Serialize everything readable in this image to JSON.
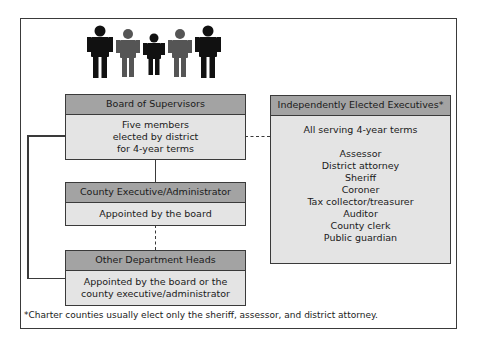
{
  "figures": {
    "icon": "people-group-icon",
    "colors": [
      "#111111",
      "#555555",
      "#111111",
      "#555555",
      "#111111"
    ]
  },
  "boxes": {
    "board": {
      "title": "Board of Supervisors",
      "lines": [
        "Five members",
        "elected by district",
        "for 4-year terms"
      ]
    },
    "executive": {
      "title": "County Executive/Administrator",
      "lines": [
        "Appointed by the board"
      ]
    },
    "departments": {
      "title": "Other Department Heads",
      "lines": [
        "Appointed by the board or the",
        "county executive/administrator"
      ]
    },
    "elected": {
      "title": "Independently Elected Executives*",
      "intro": "All serving 4-year terms",
      "offices": [
        "Assessor",
        "District attorney",
        "Sheriff",
        "Coroner",
        "Tax collector/treasurer",
        "Auditor",
        "County clerk",
        "Public guardian"
      ]
    }
  },
  "footnote": "*Charter counties usually elect only the sheriff, assessor, and district attorney.",
  "colors": {
    "header": "#a3a3a3",
    "body": "#e4e4e4",
    "border": "#3a3a3a"
  }
}
